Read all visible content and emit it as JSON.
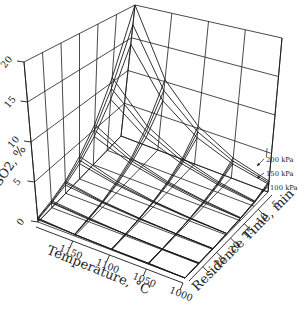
{
  "figure": {
    "background": "#ffffff",
    "stroke_color": "#1c1c1c",
    "axes": {
      "z": {
        "title": "SO2, %",
        "tick_labels": [
          "0",
          "5",
          "10",
          "15",
          "20"
        ],
        "range": [
          0,
          20
        ]
      },
      "x": {
        "title": "Temperature, °C",
        "tick_labels": [
          "1150",
          "1100",
          "1050",
          "1000"
        ],
        "range": [
          1000,
          1200
        ]
      },
      "y": {
        "title": "Residence Time, min",
        "tick_labels": [
          "5",
          "10",
          "15",
          "20",
          "25"
        ],
        "range": [
          0,
          30
        ]
      }
    },
    "annotations": [
      {
        "label": "200 kPa"
      },
      {
        "label": "150 kPa"
      },
      {
        "label": "100 kPa"
      }
    ]
  },
  "chart_data": {
    "type": "surface",
    "title": "",
    "xlabel": "Temperature, °C",
    "ylabel": "Residence Time, min",
    "zlabel": "SO2, %",
    "x_temperature_C": [
      1000,
      1050,
      1100,
      1150,
      1200
    ],
    "y_residence_time_min": [
      0,
      5,
      10,
      15,
      20,
      25,
      30
    ],
    "zlim": [
      0,
      20
    ],
    "grid": true,
    "legend": {
      "position": "right-edge annotations",
      "entries": [
        "200 kPa",
        "150 kPa",
        "100 kPa"
      ]
    },
    "series": [
      {
        "name": "200 kPa",
        "z_so2_percent": [
          [
            1.4,
            0.7,
            0.4,
            0.2,
            0.1,
            0.1,
            0.0
          ],
          [
            2.7,
            1.4,
            0.8,
            0.4,
            0.2,
            0.1,
            0.1
          ],
          [
            5.3,
            2.8,
            1.5,
            0.8,
            0.4,
            0.2,
            0.1
          ],
          [
            10.3,
            5.5,
            2.9,
            1.6,
            0.8,
            0.5,
            0.2
          ],
          [
            20.0,
            10.7,
            5.7,
            3.1,
            1.6,
            0.9,
            0.5
          ]
        ]
      },
      {
        "name": "150 kPa",
        "z_so2_percent": [
          [
            1.2,
            0.6,
            0.3,
            0.2,
            0.1,
            0.1,
            0.0
          ],
          [
            2.3,
            1.2,
            0.7,
            0.4,
            0.2,
            0.1,
            0.1
          ],
          [
            4.5,
            2.4,
            1.3,
            0.7,
            0.4,
            0.2,
            0.1
          ],
          [
            8.7,
            4.7,
            2.5,
            1.3,
            0.7,
            0.4,
            0.2
          ],
          [
            17.0,
            9.1,
            4.9,
            2.6,
            1.4,
            0.7,
            0.4
          ]
        ]
      },
      {
        "name": "100 kPa",
        "z_so2_percent": [
          [
            1.0,
            0.5,
            0.3,
            0.2,
            0.1,
            0.0,
            0.0
          ],
          [
            1.9,
            1.0,
            0.5,
            0.3,
            0.2,
            0.1,
            0.0
          ],
          [
            3.7,
            2.0,
            1.1,
            0.6,
            0.3,
            0.2,
            0.1
          ],
          [
            7.2,
            3.8,
            2.1,
            1.1,
            0.6,
            0.3,
            0.2
          ],
          [
            14.0,
            7.5,
            4.0,
            2.1,
            1.1,
            0.6,
            0.3
          ]
        ]
      }
    ]
  }
}
